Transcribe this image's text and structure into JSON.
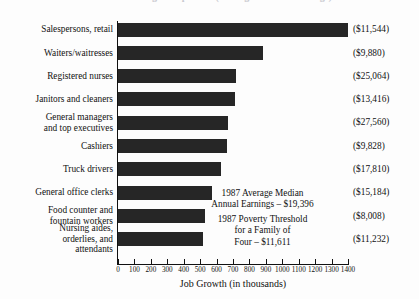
{
  "title_partial": "Fastest Growing Occupations (Average Annual Earnings)",
  "axis_title": "Job Growth (in thousands)",
  "annotations": [
    {
      "line1": "1987 Average Median",
      "line2": "Annual Earnings – $19,396"
    },
    {
      "line1": "1987 Poverty Threshold",
      "line2": "for a Family of",
      "line3": "Four – $11,611"
    }
  ],
  "chart_data": {
    "type": "bar",
    "orientation": "horizontal",
    "title": "Fastest Growing Occupations (Average Annual Earnings)",
    "xlabel": "Job Growth (in thousands)",
    "ylabel": "",
    "xlim": [
      0,
      1400
    ],
    "xticks": [
      0,
      100,
      200,
      300,
      400,
      500,
      600,
      700,
      800,
      900,
      1000,
      1100,
      1200,
      1300,
      1400
    ],
    "grid": false,
    "legend": "none",
    "bar_color": "#262626",
    "categories": [
      "Salespersons, retail",
      "Waiters/waitresses",
      "Registered nurses",
      "Janitors and cleaners",
      "General managers\nand top executives",
      "Cashiers",
      "Truck drivers",
      "General office clerks",
      "Food counter and\nfountain workers",
      "Nursing aides,\norderlies, and\nattendants"
    ],
    "values": [
      1400,
      885,
      720,
      715,
      670,
      665,
      625,
      575,
      530,
      520
    ],
    "data_labels": [
      "($11,544)",
      "($9,880)",
      "($25,064)",
      "($13,416)",
      "($27,560)",
      "($9,828)",
      "($17,810)",
      "($15,184)",
      "($8,008)",
      "($11,232)"
    ],
    "annotations": [
      "1987 Average Median Annual Earnings – $19,396",
      "1987 Poverty Threshold for a Family of Four – $11,611"
    ]
  },
  "rows": [
    {
      "label_l1": "Salespersons, retail",
      "label_l2": "",
      "label_l3": "",
      "value": "($11,544)"
    },
    {
      "label_l1": "Waiters/waitresses",
      "label_l2": "",
      "label_l3": "",
      "value": "($9,880)"
    },
    {
      "label_l1": "Registered nurses",
      "label_l2": "",
      "label_l3": "",
      "value": "($25,064)"
    },
    {
      "label_l1": "Janitors and cleaners",
      "label_l2": "",
      "label_l3": "",
      "value": "($13,416)"
    },
    {
      "label_l1": "General managers",
      "label_l2": "and top executives",
      "label_l3": "",
      "value": "($27,560)"
    },
    {
      "label_l1": "Cashiers",
      "label_l2": "",
      "label_l3": "",
      "value": "($9,828)"
    },
    {
      "label_l1": "Truck drivers",
      "label_l2": "",
      "label_l3": "",
      "value": "($17,810)"
    },
    {
      "label_l1": "General office clerks",
      "label_l2": "",
      "label_l3": "",
      "value": "($15,184)"
    },
    {
      "label_l1": "Food counter and",
      "label_l2": "fountain workers",
      "label_l3": "",
      "value": "($8,008)"
    },
    {
      "label_l1": "Nursing aides,",
      "label_l2": "orderlies, and",
      "label_l3": "attendants",
      "value": "($11,232)"
    }
  ],
  "ticks": [
    {
      "label": "0"
    },
    {
      "label": "100"
    },
    {
      "label": "200"
    },
    {
      "label": "300"
    },
    {
      "label": "400"
    },
    {
      "label": "500"
    },
    {
      "label": "600"
    },
    {
      "label": "700"
    },
    {
      "label": "800"
    },
    {
      "label": "900"
    },
    {
      "label": "1000"
    },
    {
      "label": "1100"
    },
    {
      "label": "1200"
    },
    {
      "label": "1300"
    },
    {
      "label": "1400"
    }
  ]
}
